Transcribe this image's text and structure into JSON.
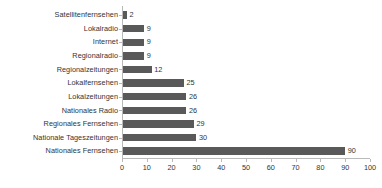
{
  "chart_data": {
    "type": "bar",
    "orientation": "horizontal",
    "title": "",
    "subtitle": "",
    "xlabel": "",
    "ylabel": "",
    "xlim": [
      0,
      100
    ],
    "xticks": [
      0,
      10,
      20,
      30,
      40,
      50,
      60,
      70,
      80,
      90,
      100
    ],
    "grid": false,
    "legend": false,
    "bar_color": "#595959",
    "axis_color": "#b9b9b9",
    "text_color": "#333333",
    "background_color": "#ffffff",
    "data_labels": true,
    "categories": [
      "Satellitenfernsehen",
      "Lokalradio",
      "Internet",
      "Regionalradio",
      "Regionalzeitungen",
      "Lokalfernsehen",
      "Lokalzeitungen",
      "Nationales Radio",
      "Regionales Fernsehen",
      "Nationale Tageszeitungen",
      "Nationales Fernsehen"
    ],
    "values": [
      2,
      9,
      9,
      9,
      12,
      25,
      26,
      26,
      29,
      30,
      90
    ],
    "value_labels": [
      "2",
      "9",
      "9",
      "9",
      "12",
      "25",
      "26",
      "26",
      "29",
      "30",
      "90"
    ],
    "tick_labels": [
      "0",
      "10",
      "20",
      "30",
      "40",
      "50",
      "60",
      "70",
      "80",
      "90",
      "100"
    ]
  }
}
